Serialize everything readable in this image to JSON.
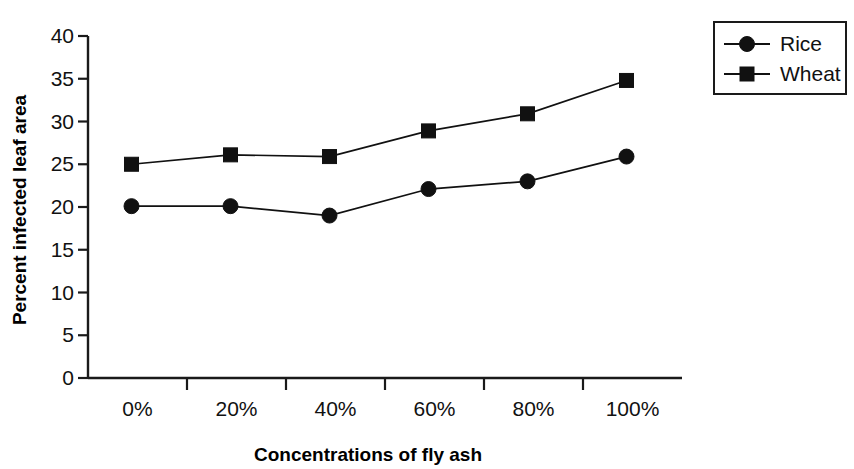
{
  "chart_data": {
    "type": "line",
    "title": "",
    "xlabel": "Concentrations of fly ash",
    "ylabel": "Percent infected leaf area",
    "categories": [
      "0%",
      "20%",
      "40%",
      "60%",
      "80%",
      "100%"
    ],
    "series": [
      {
        "name": "Rice",
        "marker": "circle",
        "values": [
          20.1,
          20.1,
          19.0,
          22.1,
          23.0,
          25.9
        ]
      },
      {
        "name": "Wheat",
        "marker": "square",
        "values": [
          25.0,
          26.1,
          25.9,
          28.9,
          30.9,
          34.8
        ]
      }
    ],
    "ylim": [
      0,
      40
    ],
    "yticks": [
      "0",
      "5",
      "10",
      "15",
      "20",
      "25",
      "30",
      "35",
      "40"
    ],
    "ytick_values": [
      0,
      5,
      10,
      15,
      20,
      25,
      30,
      35,
      40
    ],
    "grid": false,
    "legend_position": "top-right",
    "colors": {
      "series": "#111111",
      "axis": "#1a1a1a",
      "background": "#ffffff"
    }
  },
  "legend": {
    "entries": [
      {
        "label": "Rice",
        "marker": "circle-marker"
      },
      {
        "label": "Wheat",
        "marker": "square-marker"
      }
    ]
  },
  "axis": {
    "y_title": "Percent infected leaf area",
    "x_title": "Concentrations of fly ash"
  }
}
